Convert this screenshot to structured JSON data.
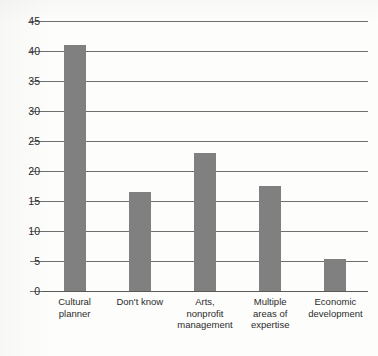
{
  "chart_data": {
    "type": "bar",
    "title": "",
    "subtitle": "",
    "xlabel": "",
    "ylabel": "",
    "categories": [
      "Cultural\nplanner",
      "Don't know",
      "Arts,\nnonprofit\nmanagement",
      "Multiple\nareas of\nexpertise",
      "Economic\ndevelopment"
    ],
    "values": [
      41,
      16.5,
      23,
      17.5,
      5.4
    ],
    "ylim": [
      0,
      45
    ],
    "yticks": [
      0,
      5,
      10,
      15,
      20,
      25,
      30,
      35,
      40,
      45
    ],
    "ytick_labels": [
      "0",
      "5",
      "10",
      "15",
      "20",
      "25",
      "30",
      "35",
      "40",
      "45"
    ],
    "grid": true,
    "legend": null,
    "legend_position": "none",
    "bar_color": "#808080",
    "grid_color": "#6f6f6f",
    "axis_color": "#5a5a5a",
    "text_color": "#2b2b2b"
  }
}
